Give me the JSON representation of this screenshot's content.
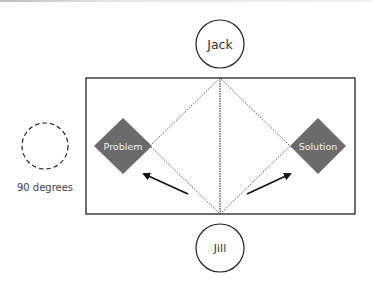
{
  "diagram": {
    "nodes": {
      "top": {
        "label": "Jack"
      },
      "bottom": {
        "label": "Jill"
      },
      "left_box": {
        "label": "Problem"
      },
      "right_box": {
        "label": "Solution"
      }
    },
    "legend": {
      "label": "90 degrees"
    },
    "colors": {
      "stroke": "#222222",
      "diamond_fill": "#6b6b6b",
      "diamond_text": "#f0f0f0",
      "text": "#333333"
    }
  }
}
